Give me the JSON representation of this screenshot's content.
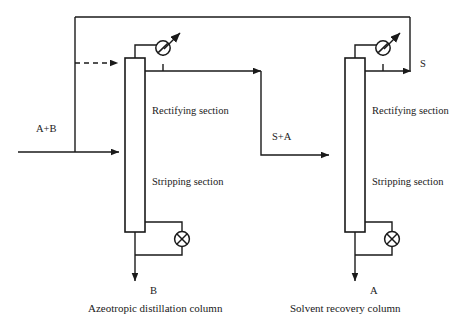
{
  "figure": {
    "type": "process-flow-diagram",
    "line_color": "#1a1a1a",
    "background_color": "#ffffff"
  },
  "streams": {
    "feed": "A+B",
    "intermediate": "S+A",
    "solvent_recycle": "S",
    "bottoms_left": "B",
    "bottoms_right": "A"
  },
  "columns": [
    {
      "id": "azeotropic",
      "caption": "Azeotropic distillation column",
      "sections": {
        "top": "Rectifying section",
        "bottom": "Stripping section"
      },
      "bottom_product": "B",
      "overhead_unit": "condenser",
      "bottom_unit": "reboiler"
    },
    {
      "id": "recovery",
      "caption": "Solvent recovery column",
      "sections": {
        "top": "Rectifying section",
        "bottom": "Stripping section"
      },
      "bottom_product": "A",
      "overhead_unit": "condenser",
      "bottom_unit": "reboiler"
    }
  ]
}
